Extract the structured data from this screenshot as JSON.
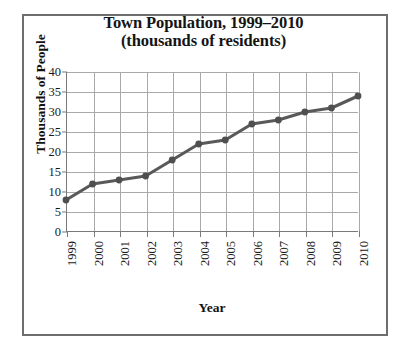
{
  "figure": {
    "frame_color": "#6e6e6e",
    "background": "#ffffff"
  },
  "chart_data": {
    "type": "line",
    "title": "Town Population, 1999–2010",
    "subtitle": "(thousands of residents)",
    "xlabel": "Year",
    "ylabel": "Thousands of People",
    "categories": [
      "1999",
      "2000",
      "2001",
      "2002",
      "2003",
      "2004",
      "2005",
      "2006",
      "2007",
      "2008",
      "2009",
      "2010"
    ],
    "values": [
      8,
      12,
      13,
      14,
      18,
      22,
      23,
      27,
      28,
      30,
      31,
      34
    ],
    "series": [
      {
        "name": "Town Population",
        "values": [
          8,
          12,
          13,
          14,
          18,
          22,
          23,
          27,
          28,
          30,
          31,
          34
        ]
      }
    ],
    "ylim": [
      0,
      40
    ],
    "ytick_labels": [
      "0",
      "5",
      "10",
      "15",
      "20",
      "25",
      "30",
      "35",
      "40"
    ],
    "ytick_values": [
      0,
      5,
      10,
      15,
      20,
      25,
      30,
      35,
      40
    ],
    "ytick_step": 5,
    "xtick_labels": [
      "1999",
      "2000",
      "2001",
      "2002",
      "2003",
      "2004",
      "2005",
      "2006",
      "2007",
      "2008",
      "2009",
      "2010"
    ],
    "xtick_label_rotation": -90,
    "grid": true,
    "grid_color": "#a9a9a9",
    "legend": false,
    "legend_position": "none",
    "line_color": "#595959",
    "marker_color": "#4f4f4f",
    "marker": "circle",
    "axis_color": "#7a7a7a"
  }
}
